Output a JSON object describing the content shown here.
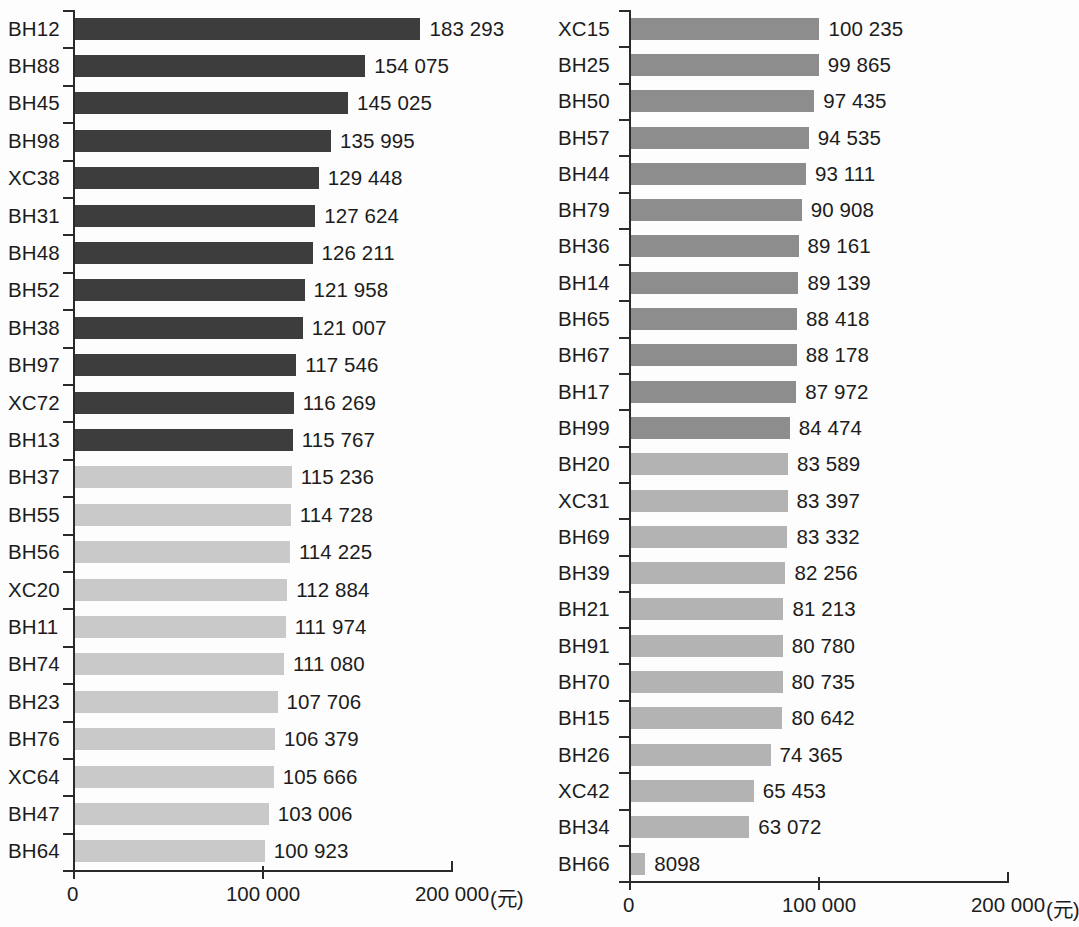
{
  "chart_data": {
    "type": "bar",
    "orientation": "horizontal",
    "title": "",
    "xlabel": "",
    "ylabel": "",
    "xlim": [
      0,
      200000
    ],
    "xticks": [
      0,
      100000,
      200000
    ],
    "xtick_labels": [
      "0",
      "100 000",
      "200 000"
    ],
    "unit": "(元)",
    "grid": false,
    "legend": "none",
    "panels": [
      {
        "name": "left-panel",
        "categories": [
          "BH12",
          "BH88",
          "BH45",
          "BH98",
          "XC38",
          "BH31",
          "BH48",
          "BH52",
          "BH38",
          "BH97",
          "XC72",
          "BH13",
          "BH37",
          "BH55",
          "BH56",
          "XC20",
          "BH11",
          "BH74",
          "BH23",
          "BH76",
          "XC64",
          "BH47",
          "BH64"
        ],
        "values": [
          183293,
          154075,
          145025,
          135995,
          129448,
          127624,
          126211,
          121958,
          121007,
          117546,
          116269,
          115767,
          115236,
          114728,
          114225,
          112884,
          111974,
          111080,
          107706,
          106379,
          105666,
          103006,
          100923
        ],
        "value_labels": [
          "183 293",
          "154 075",
          "145 025",
          "135 995",
          "129 448",
          "127 624",
          "126 211",
          "121 958",
          "121 007",
          "117 546",
          "116 269",
          "115 767",
          "115 236",
          "114 728",
          "114 225",
          "112 884",
          "111 974",
          "111 080",
          "107 706",
          "106 379",
          "105 666",
          "103 006",
          "100 923"
        ],
        "bar_colors": [
          "#3d3d3d",
          "#3d3d3d",
          "#3d3d3d",
          "#3d3d3d",
          "#3d3d3d",
          "#3d3d3d",
          "#3d3d3d",
          "#3d3d3d",
          "#3d3d3d",
          "#3d3d3d",
          "#3d3d3d",
          "#3d3d3d",
          "#c9c9c9",
          "#c9c9c9",
          "#c9c9c9",
          "#c9c9c9",
          "#c9c9c9",
          "#c9c9c9",
          "#c9c9c9",
          "#c9c9c9",
          "#c9c9c9",
          "#c9c9c9",
          "#c9c9c9"
        ]
      },
      {
        "name": "right-panel",
        "categories": [
          "XC15",
          "BH25",
          "BH50",
          "BH57",
          "BH44",
          "BH79",
          "BH36",
          "BH14",
          "BH65",
          "BH67",
          "BH17",
          "BH99",
          "BH20",
          "XC31",
          "BH69",
          "BH39",
          "BH21",
          "BH91",
          "BH70",
          "BH15",
          "BH26",
          "XC42",
          "BH34",
          "BH66"
        ],
        "values": [
          100235,
          99865,
          97435,
          94535,
          93111,
          90908,
          89161,
          89139,
          88418,
          88178,
          87972,
          84474,
          83589,
          83397,
          83332,
          82256,
          81213,
          80780,
          80735,
          80642,
          74365,
          65453,
          63072,
          8098
        ],
        "value_labels": [
          "100 235",
          "99 865",
          "97 435",
          "94 535",
          "93 111",
          "90 908",
          "89 161",
          "89 139",
          "88 418",
          "88 178",
          "87 972",
          "84 474",
          "83 589",
          "83 397",
          "83 332",
          "82 256",
          "81 213",
          "80 780",
          "80 735",
          "80 642",
          "74 365",
          "65 453",
          "63 072",
          "8098"
        ],
        "bar_colors": [
          "#8d8d8d",
          "#8d8d8d",
          "#8d8d8d",
          "#8d8d8d",
          "#8d8d8d",
          "#8d8d8d",
          "#8d8d8d",
          "#8d8d8d",
          "#8d8d8d",
          "#8d8d8d",
          "#8d8d8d",
          "#8d8d8d",
          "#b3b3b3",
          "#b3b3b3",
          "#b3b3b3",
          "#b3b3b3",
          "#b3b3b3",
          "#b3b3b3",
          "#b3b3b3",
          "#b3b3b3",
          "#b3b3b3",
          "#b3b3b3",
          "#b3b3b3",
          "#b3b3b3"
        ]
      }
    ]
  },
  "colors": {
    "bar_dark": "#3d3d3d",
    "bar_light": "#c9c9c9",
    "bar_medium": "#8d8d8d",
    "bar_medium_light": "#b3b3b3",
    "axis": "#2a2a2a",
    "text": "#1c1c1c",
    "background": "#fdfdfd"
  }
}
